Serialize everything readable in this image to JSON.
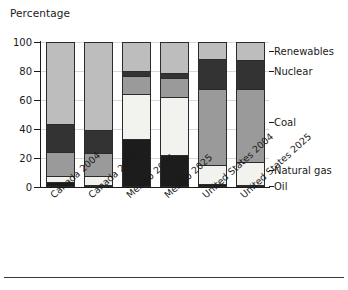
{
  "axis_title": "Percentage",
  "chart_data": {
    "type": "bar",
    "subtype": "stacked-100",
    "title": "",
    "subtitle": "",
    "xlabel": "",
    "ylabel": "Percentage",
    "ylim": [
      0,
      100
    ],
    "yticks": [
      0,
      20,
      40,
      60,
      80,
      100
    ],
    "ytick_labels": [
      "0",
      "20",
      "40",
      "60",
      "80",
      "100"
    ],
    "grid": true,
    "legend_position": "right-inline",
    "categories": [
      "Canada 2004",
      "Canada 2025",
      "Mexico 2004",
      "Mexico 2025",
      "United States 2004",
      "United States 2025"
    ],
    "series": [
      {
        "name": "Oil",
        "color": "#1c1c1c",
        "values": [
          4,
          2,
          34,
          23,
          3,
          2
        ]
      },
      {
        "name": "Natural gas",
        "color": "#f2f2ee",
        "values": [
          4,
          6,
          31,
          40,
          13,
          16
        ]
      },
      {
        "name": "Coal",
        "color": "#9a9a9a",
        "values": [
          17,
          16,
          12,
          13,
          52,
          50
        ]
      },
      {
        "name": "Nuclear",
        "color": "#333333",
        "values": [
          19,
          16,
          4,
          3,
          21,
          20
        ]
      },
      {
        "name": "Renewables",
        "color": "#bdbdbd",
        "values": [
          56,
          60,
          19,
          21,
          11,
          12
        ]
      }
    ],
    "cumulative_tops": {
      "Canada 2004": {
        "Oil": 4,
        "Natural gas": 8,
        "Coal": 25,
        "Nuclear": 44,
        "Renewables": 100
      },
      "Canada 2025": {
        "Oil": 2,
        "Natural gas": 8,
        "Coal": 24,
        "Nuclear": 40,
        "Renewables": 100
      },
      "Mexico 2004": {
        "Oil": 34,
        "Natural gas": 65,
        "Coal": 77,
        "Nuclear": 81,
        "Renewables": 100
      },
      "Mexico 2025": {
        "Oil": 23,
        "Natural gas": 63,
        "Coal": 76,
        "Nuclear": 79,
        "Renewables": 100
      },
      "United States 2004": {
        "Oil": 3,
        "Natural gas": 16,
        "Coal": 68,
        "Nuclear": 89,
        "Renewables": 100
      },
      "United States 2025": {
        "Oil": 2,
        "Natural gas": 18,
        "Coal": 68,
        "Nuclear": 88,
        "Renewables": 100
      }
    },
    "legend_labels": [
      "Renewables",
      "Nuclear",
      "Coal",
      "Natural gas",
      "Oil"
    ],
    "legend_anchor_values": [
      94,
      80,
      45,
      12,
      1
    ]
  }
}
